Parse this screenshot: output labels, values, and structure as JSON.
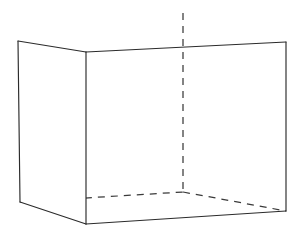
{
  "figure": {
    "title": "Open box perspective line drawing",
    "background_color": "#ffffff",
    "solid_stroke_color": "#2b2b2b",
    "hidden_stroke_color": "#3a3a3a",
    "stroke_width": 1.15,
    "hidden_dash_pattern": "7 6",
    "canvas": {
      "width": 296,
      "height": 239
    },
    "vertices": {
      "top_back_left": {
        "x": 18,
        "y": 41,
        "label": "top-back-left"
      },
      "top_front_left": {
        "x": 86,
        "y": 52,
        "label": "top-front-left"
      },
      "top_back_right": {
        "x": 286,
        "y": 42,
        "label": "top-back-right"
      },
      "bottom_back_left": {
        "x": 20,
        "y": 202,
        "label": "bottom-back-left"
      },
      "bottom_front_left": {
        "x": 86,
        "y": 224,
        "label": "bottom-front-left"
      },
      "bottom_back_right": {
        "x": 286,
        "y": 211,
        "label": "bottom-back-right"
      },
      "floor_back_corner": {
        "x": 183,
        "y": 192,
        "label": "floor-back-corner"
      },
      "vertical_axis_top": {
        "x": 183,
        "y": 13,
        "label": "vertical-axis-top"
      }
    },
    "edges": {
      "left_panel_top": "18,41 86,52",
      "left_panel_left_vertical": "18,41 20,202",
      "left_panel_bottom": "20,202 86,224",
      "center_vertical": "86,52 86,224",
      "back_panel_top": "86,52 286,42",
      "back_panel_bottom": "86,224 286,211",
      "right_vertical": "286,42 286,211",
      "hidden_vertical": "183,13 183,192",
      "hidden_floor_left": "20,202 183,192",
      "hidden_floor_right": "183,192 286,211"
    },
    "faces": [
      {
        "name": "left-wall-face",
        "points": "18,41 86,52 86,224 20,202"
      },
      {
        "name": "back-wall-face",
        "points": "86,52 286,42 286,211 86,224"
      },
      {
        "name": "floor-face",
        "points": "20,202 183,192 286,211 86,224"
      }
    ]
  },
  "chart_data": {
    "type": "line",
    "title": "Open box perspective line drawing",
    "xlabel": "",
    "ylabel": "",
    "xlim": [
      0,
      296
    ],
    "ylim": [
      239,
      0
    ],
    "grid": false,
    "legend": "none",
    "series": [
      {
        "name": "left-panel-top-edge",
        "style": "solid",
        "x": [
          18,
          86
        ],
        "y": [
          41,
          52
        ]
      },
      {
        "name": "left-panel-vertical-edge",
        "style": "solid",
        "x": [
          18,
          20
        ],
        "y": [
          41,
          202
        ]
      },
      {
        "name": "left-panel-bottom-edge",
        "style": "solid",
        "x": [
          20,
          86
        ],
        "y": [
          202,
          224
        ]
      },
      {
        "name": "center-vertical-edge",
        "style": "solid",
        "x": [
          86,
          86
        ],
        "y": [
          52,
          224
        ]
      },
      {
        "name": "back-panel-top-edge",
        "style": "solid",
        "x": [
          86,
          286
        ],
        "y": [
          52,
          42
        ]
      },
      {
        "name": "back-panel-bottom-edge",
        "style": "solid",
        "x": [
          86,
          286
        ],
        "y": [
          224,
          211
        ]
      },
      {
        "name": "right-vertical-edge",
        "style": "solid",
        "x": [
          286,
          286
        ],
        "y": [
          42,
          211
        ]
      },
      {
        "name": "hidden-vertical-edge",
        "style": "dashed",
        "x": [
          183,
          183
        ],
        "y": [
          13,
          192
        ]
      },
      {
        "name": "hidden-floor-left-edge",
        "style": "dashed",
        "x": [
          20,
          183
        ],
        "y": [
          202,
          192
        ]
      },
      {
        "name": "hidden-floor-right-edge",
        "style": "dashed",
        "x": [
          183,
          286
        ],
        "y": [
          192,
          211
        ]
      }
    ]
  }
}
